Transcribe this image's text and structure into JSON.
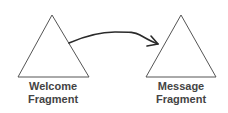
{
  "diagram": {
    "type": "flow",
    "nodes": [
      {
        "id": "welcome",
        "shape": "triangle",
        "label_line1": "Welcome",
        "label_line2": "Fragment",
        "apex": [
          52,
          15
        ],
        "base_left": [
          18,
          77
        ],
        "base_right": [
          89,
          77
        ]
      },
      {
        "id": "message",
        "shape": "triangle",
        "label_line1": "Message",
        "label_line2": "Fragment",
        "apex": [
          181,
          15
        ],
        "base_left": [
          146,
          77
        ],
        "base_right": [
          216,
          77
        ]
      }
    ],
    "edges": [
      {
        "from": "welcome",
        "to": "message",
        "style": "hand-drawn curved arrow"
      }
    ],
    "colors": {
      "triangle_stroke": "#555555",
      "arrow_stroke": "#2a2a2a",
      "label_text": "#444444",
      "background": "#ffffff"
    }
  }
}
